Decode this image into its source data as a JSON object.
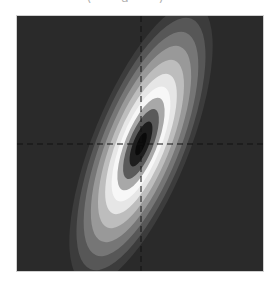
{
  "chart_data": {
    "type": "heatmap",
    "subtype": "filled-contour",
    "title": "(a)",
    "title_visible": "clipped at top edge",
    "xlabel": "",
    "ylabel": "",
    "grid": false,
    "legend": null,
    "colormap": "grayscale (dark center, white ring, dark outside)",
    "crosshair": {
      "style": "dashed",
      "color": "#111111",
      "x_px": 140,
      "y_px": 143
    },
    "ellipse": {
      "center_px": [
        140,
        143
      ],
      "semi_major_px": 150,
      "semi_minor_px": 48,
      "rotation_deg": 22
    },
    "levels": [
      {
        "scale": 1.0,
        "color": "#3c3c3c"
      },
      {
        "scale": 0.9,
        "color": "#575757"
      },
      {
        "scale": 0.8,
        "color": "#767676"
      },
      {
        "scale": 0.7,
        "color": "#999999"
      },
      {
        "scale": 0.6,
        "color": "#bdbdbd"
      },
      {
        "scale": 0.5,
        "color": "#e6e6e6"
      },
      {
        "scale": 0.41,
        "color": "#f7f7f7"
      },
      {
        "scale": 0.33,
        "color": "#a8a8a8"
      },
      {
        "scale": 0.25,
        "color": "#5a5a5a"
      },
      {
        "scale": 0.16,
        "color": "#1e1e1e"
      },
      {
        "scale": 0.08,
        "color": "#0a0a0a"
      }
    ],
    "background_color": "#2a2a2a"
  }
}
